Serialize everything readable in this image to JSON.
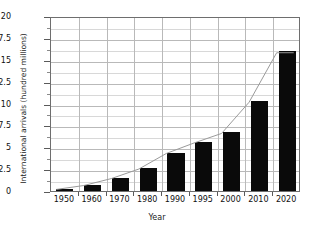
{
  "chart_data": {
    "type": "bar",
    "title": "",
    "xlabel": "Year",
    "ylabel": "International arrivals (hundred millions)",
    "categories": [
      "1950",
      "1960",
      "1970",
      "1980",
      "1990",
      "1995",
      "2000",
      "2010",
      "2020"
    ],
    "values": [
      0.25,
      0.7,
      1.5,
      2.6,
      4.4,
      5.6,
      6.7,
      10.3,
      16.0
    ],
    "series": [
      {
        "name": "International arrivals",
        "values": [
          0.25,
          0.7,
          1.5,
          2.6,
          4.4,
          5.6,
          6.7,
          10.3,
          16.0
        ]
      }
    ],
    "overlay_line": {
      "present": true,
      "color": "#999999",
      "description": "thin gray line connecting the tops of the bars"
    },
    "ylim": [
      0,
      20
    ],
    "yticks": [
      0,
      2.5,
      5,
      7.5,
      10,
      12.5,
      15,
      17.5,
      20
    ],
    "ytick_labels": [
      "0",
      "2.5",
      "5",
      "7.5",
      "10",
      "12.5",
      "15",
      "17.5",
      "20"
    ],
    "yminor_ticks": [
      1.25,
      3.75,
      6.25,
      8.75,
      11.25,
      13.75,
      16.25,
      18.75
    ],
    "grid": true,
    "grid_axis": "both",
    "legend": false,
    "bar_color": "#0a0a0a",
    "grid_color": "#b9b9b9",
    "frame_color": "#6e6e6e"
  }
}
